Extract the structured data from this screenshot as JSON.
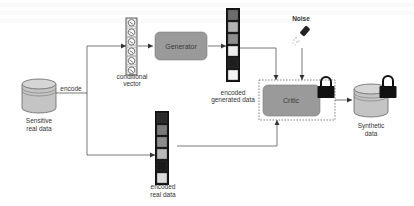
{
  "diagram": {
    "nodes": {
      "source_db": {
        "label_line1": "Sensitive",
        "label_line2": "real data"
      },
      "encode_edge": {
        "label": "encode"
      },
      "conditional_vector": {
        "label_line1": "conditional",
        "label_line2": "vector",
        "cells": 6
      },
      "generator": {
        "label": "Generator"
      },
      "encoded_generated": {
        "label_line1": "encoded",
        "label_line2": "generated data",
        "cells": [
          "#6d6d6d",
          "#b3b3b3",
          "#8e8e8e",
          "#eeeeee",
          "#1e1e1e",
          "#f4f4f4"
        ]
      },
      "noise": {
        "label": "Noise"
      },
      "critic": {
        "label": "Critic",
        "locked": true
      },
      "synthetic_db": {
        "label_line1": "Synthetic",
        "label_line2": "data",
        "locked": true
      },
      "encoded_real": {
        "label_line1": "encoded",
        "label_line2": "real data",
        "cells": [
          "#2a2a2a",
          "#7a7a7a",
          "#8d8d8d",
          "#b9b9b9",
          "#1a1a1a",
          "#dcdcdc"
        ]
      }
    },
    "colors": {
      "box_fill": "#9a9a9a",
      "db_fill": "#c4c4c4",
      "line": "#555555",
      "lock": "#111111"
    },
    "edges": [
      {
        "from": "source_db",
        "to": "conditional_vector",
        "label": "encode"
      },
      {
        "from": "source_db",
        "to": "encoded_real"
      },
      {
        "from": "conditional_vector",
        "to": "generator"
      },
      {
        "from": "generator",
        "to": "encoded_generated"
      },
      {
        "from": "encoded_generated",
        "to": "critic"
      },
      {
        "from": "noise",
        "to": "critic"
      },
      {
        "from": "encoded_real",
        "to": "critic"
      },
      {
        "from": "critic",
        "to": "synthetic_db"
      }
    ]
  }
}
